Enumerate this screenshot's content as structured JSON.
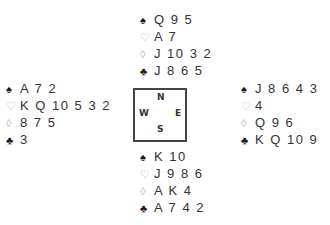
{
  "deal": {
    "north": {
      "spades": "Q 9 5",
      "hearts": "A 7",
      "diamonds": "J 10 3 2",
      "clubs": "J 8 6 5"
    },
    "west": {
      "spades": "A 7 2",
      "hearts": "K Q 10 5 3 2",
      "diamonds": "8 7 5",
      "clubs": "3"
    },
    "east": {
      "spades": "J 8 6 4 3",
      "hearts": "4",
      "diamonds": "Q 9 6",
      "clubs": "K Q 10 9"
    },
    "south": {
      "spades": "K 10",
      "hearts": "J 9 8 6",
      "diamonds": "A K 4",
      "clubs": "A 7 4 2"
    }
  },
  "compass": {
    "n": "N",
    "s": "S",
    "w": "W",
    "e": "E"
  },
  "symbols": {
    "spade": "♠",
    "heart": "♡",
    "diamond": "◊",
    "club": "♣"
  },
  "colors": {
    "black_suit": "#1a1a1a",
    "red_suit_outline": "#b8b8b8",
    "text": "#333333",
    "box_border": "#444444"
  }
}
